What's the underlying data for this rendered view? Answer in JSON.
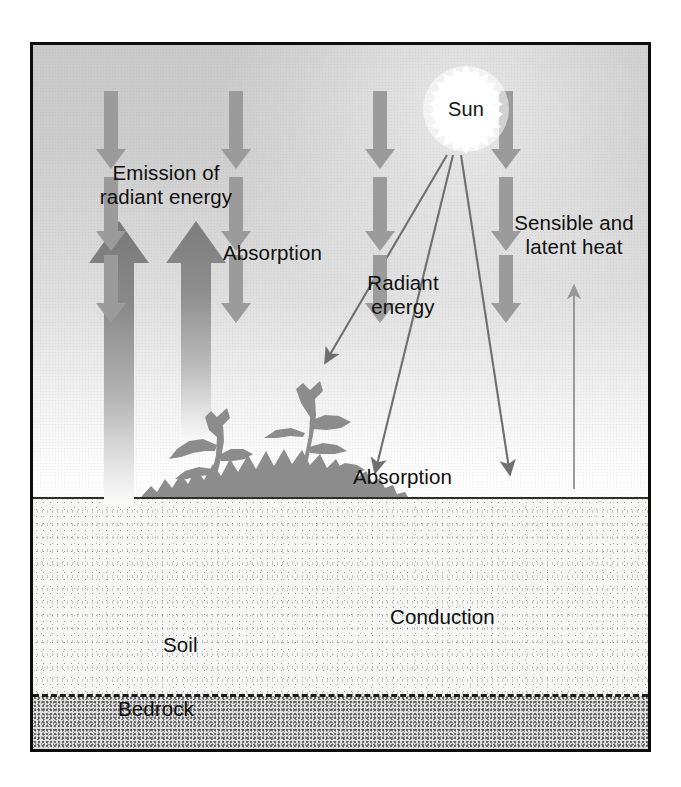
{
  "diagram": {
    "sun": {
      "label": "Sun"
    },
    "labels": {
      "emission": "Emission of\nradiant energy",
      "absorption_canopy": "Absorption",
      "radiant_energy": "Radiant\nenergy",
      "sensible_latent": "Sensible and\nlatent heat",
      "absorption_ground": "Absorption",
      "conduction": "Conduction",
      "soil": "Soil",
      "bedrock": "Bedrock"
    },
    "colors": {
      "frame": "#0d0d0d",
      "sky_top": "#c9c9c9",
      "sky_bottom": "#ffffff",
      "sun_body": "#ffffff",
      "arrow_gray": "#8f8f8f",
      "arrow_dark": "#7a7a7a",
      "ray_line": "#777777",
      "soil_fill": "#f6f6f4",
      "bedrock_fill": "#dedede",
      "text": "#0f0f0f",
      "vegetation": "#8c8c8c"
    },
    "emission_arrows": [
      {
        "name": "emission-arrow-left",
        "x": 86,
        "top": 176,
        "bottom": 460,
        "width": 30
      },
      {
        "name": "emission-arrow-right",
        "x": 163,
        "top": 176,
        "bottom": 400,
        "width": 30
      }
    ],
    "sun_rays": [
      {
        "name": "ray-absorption-canopy",
        "x1": 444,
        "y1": 148,
        "x2": 322,
        "y2": 356
      },
      {
        "name": "ray-radiant-center",
        "x1": 450,
        "y1": 148,
        "x2": 372,
        "y2": 466
      },
      {
        "name": "ray-radiant-right",
        "x1": 458,
        "y1": 148,
        "x2": 507,
        "y2": 468
      }
    ],
    "heat_arrow": {
      "name": "sensible-latent-arrow",
      "x": 571,
      "y_bottom": 482,
      "y_top": 278
    },
    "soil_arrow_columns": [
      108,
      233,
      377,
      503
    ],
    "soil_arrow_rows": [
      {
        "top": 500,
        "bottom": 572
      },
      {
        "top": 586,
        "bottom": 652
      },
      {
        "top": 664,
        "bottom": 724
      }
    ]
  }
}
